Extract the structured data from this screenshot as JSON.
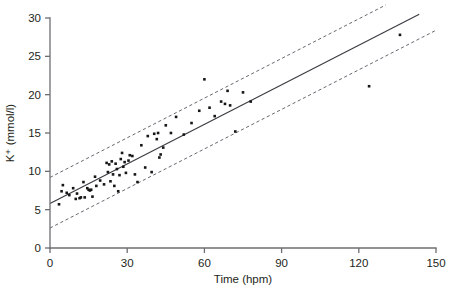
{
  "chart_data": {
    "type": "scatter",
    "title": "",
    "subtitle": "",
    "xlabel": "Time (hpm)",
    "ylabel": "K+ (mmol/l)",
    "ylabel_display": "K⁺ (mmol/l)",
    "xlim": [
      0,
      150
    ],
    "ylim": [
      0,
      30
    ],
    "xticks": [
      0,
      30,
      60,
      90,
      120,
      150
    ],
    "yticks": [
      0,
      5,
      10,
      15,
      20,
      25,
      30
    ],
    "xtick_labels": [
      "0",
      "30",
      "60",
      "90",
      "120",
      "150"
    ],
    "ytick_labels": [
      "0",
      "5",
      "10",
      "15",
      "20",
      "25",
      "30"
    ],
    "grid": false,
    "legend": null,
    "annotations": [],
    "marker": "filled-square",
    "marker_size_px": 2.6,
    "series": [
      {
        "name": "observations",
        "type": "scatter",
        "color": "#161616",
        "points": [
          [
            3.5,
            5.7
          ],
          [
            4.5,
            7.4
          ],
          [
            5.0,
            8.2
          ],
          [
            6.5,
            7.2
          ],
          [
            7.5,
            6.9
          ],
          [
            9.0,
            7.8
          ],
          [
            10.0,
            6.4
          ],
          [
            10.5,
            7.1
          ],
          [
            11.5,
            6.5
          ],
          [
            12.0,
            6.6
          ],
          [
            13.0,
            8.6
          ],
          [
            13.5,
            6.6
          ],
          [
            14.5,
            7.8
          ],
          [
            15.0,
            7.6
          ],
          [
            15.5,
            7.5
          ],
          [
            16.0,
            7.6
          ],
          [
            16.5,
            6.7
          ],
          [
            17.5,
            9.3
          ],
          [
            18.0,
            8.1
          ],
          [
            19.5,
            8.8
          ],
          [
            21.0,
            8.3
          ],
          [
            22.0,
            11.1
          ],
          [
            22.5,
            9.9
          ],
          [
            23.0,
            10.9
          ],
          [
            23.5,
            8.7
          ],
          [
            24.0,
            11.3
          ],
          [
            24.5,
            9.6
          ],
          [
            25.0,
            8.1
          ],
          [
            25.5,
            11.0
          ],
          [
            26.0,
            10.3
          ],
          [
            26.5,
            7.4
          ],
          [
            27.0,
            9.5
          ],
          [
            27.5,
            11.6
          ],
          [
            28.0,
            12.4
          ],
          [
            28.5,
            10.6
          ],
          [
            29.0,
            11.2
          ],
          [
            29.5,
            9.8
          ],
          [
            30.5,
            11.4
          ],
          [
            31.0,
            12.1
          ],
          [
            32.0,
            12.0
          ],
          [
            33.0,
            9.6
          ],
          [
            34.0,
            8.6
          ],
          [
            35.5,
            13.4
          ],
          [
            37.0,
            10.5
          ],
          [
            38.0,
            14.6
          ],
          [
            39.5,
            9.9
          ],
          [
            40.5,
            14.9
          ],
          [
            41.5,
            14.2
          ],
          [
            42.0,
            15.0
          ],
          [
            42.5,
            11.8
          ],
          [
            43.0,
            12.2
          ],
          [
            44.0,
            13.1
          ],
          [
            45.0,
            16.0
          ],
          [
            47.0,
            15.0
          ],
          [
            49.0,
            17.1
          ],
          [
            52.0,
            14.8
          ],
          [
            55.0,
            16.3
          ],
          [
            58.0,
            17.9
          ],
          [
            60.0,
            22.0
          ],
          [
            62.0,
            18.3
          ],
          [
            64.0,
            17.2
          ],
          [
            66.5,
            19.1
          ],
          [
            68.0,
            18.8
          ],
          [
            69.0,
            20.5
          ],
          [
            70.0,
            18.6
          ],
          [
            72.0,
            15.2
          ],
          [
            75.0,
            20.3
          ],
          [
            78.0,
            19.1
          ],
          [
            124.0,
            21.1
          ],
          [
            136.0,
            27.8
          ]
        ]
      },
      {
        "name": "regression-line",
        "type": "line",
        "style": "solid",
        "color": "#3b3b42",
        "x": [
          0,
          143.5
        ],
        "y": [
          5.8,
          30.5
        ]
      },
      {
        "name": "upper-prediction-band",
        "type": "line",
        "style": "dashed",
        "color": "#5f5f68",
        "x": [
          0,
          130.5
        ],
        "y": [
          9.2,
          31.7
        ]
      },
      {
        "name": "lower-prediction-band",
        "type": "line",
        "style": "dashed",
        "color": "#5f5f68",
        "x": [
          0,
          150
        ],
        "y": [
          2.6,
          28.4
        ]
      }
    ]
  },
  "figure": {
    "background_color": "#ffffff",
    "axis_color": "#6d6e71",
    "text_color": "#231f20"
  }
}
